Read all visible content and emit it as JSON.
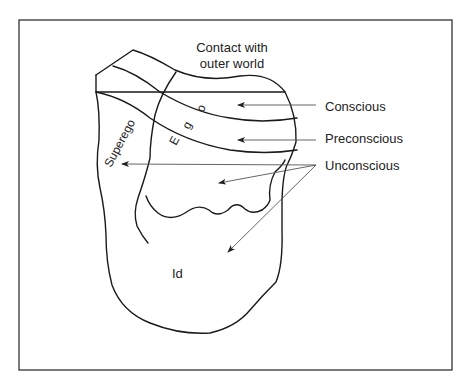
{
  "diagram": {
    "title_note": "Contact with outer world",
    "contact_label": {
      "line1": "Contact with",
      "line2": "outer world"
    },
    "regions": {
      "superego": "Superego",
      "ego_letters": [
        "E",
        "g",
        "o"
      ],
      "id": "Id"
    },
    "levels": [
      {
        "label": "Conscious",
        "arrow_count": 1
      },
      {
        "label": "Preconscious",
        "arrow_count": 1
      },
      {
        "label": "Unconscious",
        "arrow_count": 3
      }
    ],
    "colors": {
      "outline": "#1a1a1a",
      "arrow": "#555555",
      "frame": "#333333",
      "background": "#ffffff"
    }
  }
}
